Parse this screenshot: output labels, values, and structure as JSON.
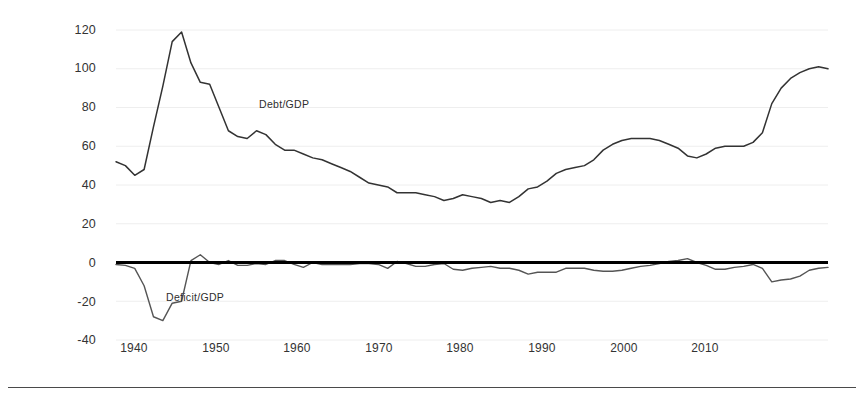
{
  "chart_data": {
    "type": "line",
    "title": "",
    "subtitle": "",
    "xlabel": "",
    "ylabel": "(Percent of GDP)",
    "xlim": [
      1939,
      2015
    ],
    "ylim": [
      -40,
      120
    ],
    "y_ticks": [
      120,
      100,
      80,
      60,
      40,
      20,
      0,
      -20,
      -40
    ],
    "x_ticks": [
      1940,
      1950,
      1960,
      1970,
      1980,
      1990,
      2000,
      2010
    ],
    "grid": "faint-horizontal",
    "legend_position": "inline-annotation",
    "zero_line": 0,
    "series": [
      {
        "name": "Debt/GDP",
        "color": "#333333",
        "x": [
          1939,
          1940,
          1941,
          1942,
          1943,
          1944,
          1945,
          1946,
          1947,
          1948,
          1949,
          1950,
          1951,
          1952,
          1953,
          1954,
          1955,
          1956,
          1957,
          1958,
          1959,
          1960,
          1961,
          1962,
          1963,
          1964,
          1965,
          1966,
          1967,
          1968,
          1969,
          1970,
          1971,
          1972,
          1973,
          1974,
          1975,
          1976,
          1977,
          1978,
          1979,
          1980,
          1981,
          1982,
          1983,
          1984,
          1985,
          1986,
          1987,
          1988,
          1989,
          1990,
          1991,
          1992,
          1993,
          1994,
          1995,
          1996,
          1997,
          1998,
          1999,
          2000,
          2001,
          2002,
          2003,
          2004,
          2005,
          2006,
          2007,
          2008,
          2009,
          2010,
          2011,
          2012,
          2013,
          2014,
          2015
        ],
        "values": [
          52,
          50,
          45,
          48,
          70,
          91,
          114,
          119,
          103,
          93,
          92,
          80,
          68,
          65,
          64,
          68,
          66,
          61,
          58,
          58,
          56,
          54,
          53,
          51,
          49,
          47,
          44,
          41,
          40,
          39,
          36,
          36,
          36,
          35,
          34,
          32,
          33,
          35,
          34,
          33,
          31,
          32,
          31,
          34,
          38,
          39,
          42,
          46,
          48,
          49,
          50,
          53,
          58,
          61,
          63,
          64,
          64,
          64,
          63,
          61,
          59,
          55,
          54,
          56,
          59,
          60,
          60,
          60,
          62,
          67,
          82,
          90,
          95,
          98,
          100,
          101,
          100
        ]
      },
      {
        "name": "Deficit/GDP",
        "color": "#555555",
        "x": [
          1939,
          1940,
          1941,
          1942,
          1943,
          1944,
          1945,
          1946,
          1947,
          1948,
          1949,
          1950,
          1951,
          1952,
          1953,
          1954,
          1955,
          1956,
          1957,
          1958,
          1959,
          1960,
          1961,
          1962,
          1963,
          1964,
          1965,
          1966,
          1967,
          1968,
          1969,
          1970,
          1971,
          1972,
          1973,
          1974,
          1975,
          1976,
          1977,
          1978,
          1979,
          1980,
          1981,
          1982,
          1983,
          1984,
          1985,
          1986,
          1987,
          1988,
          1989,
          1990,
          1991,
          1992,
          1993,
          1994,
          1995,
          1996,
          1997,
          1998,
          1999,
          2000,
          2001,
          2002,
          2003,
          2004,
          2005,
          2006,
          2007,
          2008,
          2009,
          2010,
          2011,
          2012,
          2013,
          2014,
          2015
        ],
        "values": [
          -1,
          -1.5,
          -3,
          -12,
          -28,
          -30,
          -21,
          -20,
          1,
          4,
          0,
          -1,
          1,
          -1.5,
          -1.5,
          -0.5,
          -1,
          1,
          1,
          -1,
          -2.5,
          0,
          -1,
          -1,
          -1,
          -1,
          -0.5,
          -0.5,
          -1,
          -3,
          0.5,
          -0.5,
          -2,
          -2,
          -1,
          -0.5,
          -3.5,
          -4,
          -3,
          -2.5,
          -2,
          -3,
          -3,
          -4,
          -6,
          -5,
          -5,
          -5,
          -3,
          -3,
          -3,
          -4,
          -4.5,
          -4.5,
          -4,
          -3,
          -2,
          -1.5,
          -0.5,
          0.5,
          1,
          2,
          0,
          -1.5,
          -3.5,
          -3.5,
          -2.5,
          -2,
          -1,
          -3,
          -10,
          -9,
          -8.5,
          -7,
          -4,
          -3,
          -2.5
        ]
      }
    ],
    "annotations": [
      {
        "text": "Debt/GDP",
        "x": 1955,
        "y": 88
      },
      {
        "text": "Deficit/GDP",
        "x": 1947,
        "y": -17
      }
    ]
  },
  "axis": {
    "y_title": "(Percent of GDP)",
    "y_ticks": [
      "120",
      "100",
      "80",
      "60",
      "40",
      "20",
      "0",
      "-20",
      "-40"
    ],
    "x_ticks": [
      "1940",
      "1950",
      "1960",
      "1970",
      "1980",
      "1990",
      "2000",
      "2010"
    ]
  },
  "labels": {
    "debt": "Debt/GDP",
    "deficit": "Deficit/GDP"
  },
  "colors": {
    "debt_line": "#333333",
    "deficit_line": "#555555",
    "zero_line": "#000000",
    "grid": "#eeeeee",
    "rule": "#4a4a4a"
  }
}
